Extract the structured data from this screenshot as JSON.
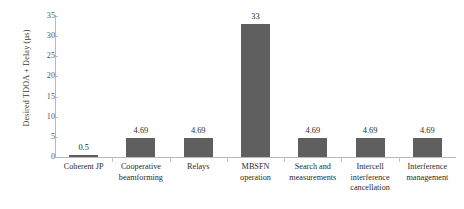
{
  "chart_data": {
    "type": "bar",
    "title": "",
    "xlabel": "",
    "ylabel": "Desired TDOA + Delay (µs)",
    "ylim": [
      0,
      35
    ],
    "yticks": [
      0,
      5,
      10,
      15,
      20,
      25,
      30,
      35
    ],
    "ytick_labels": [
      "0",
      "5",
      "10",
      "15",
      "20",
      "25",
      "30",
      "35"
    ],
    "grid": false,
    "legend": false,
    "bar_color": "#5f5f5f",
    "categories": [
      "Coherent JP",
      "Cooperative beamforming",
      "Relays",
      "MBSFN operation",
      "Search and measurements",
      "Intercell interference cancellation",
      "Interference management"
    ],
    "values": [
      0.5,
      4.69,
      4.69,
      33,
      4.69,
      4.69,
      4.69
    ],
    "value_labels": [
      "0.5",
      "4.69",
      "4.69",
      "33",
      "4.69",
      "4.69",
      "4.69"
    ]
  }
}
